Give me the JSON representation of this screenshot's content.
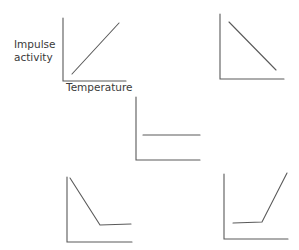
{
  "figure": {
    "ylabel": "Impulse activity",
    "ylabel_lines": [
      "Impulse",
      "activity"
    ],
    "xlabel": "Temperature",
    "line_color": "#5a5a5a",
    "text_color": "#3a3a3a"
  },
  "graphs": [
    {
      "id": "top-left",
      "shape": "linear increasing",
      "axes": {
        "x0": 63,
        "y_top": 18,
        "y_base": 81,
        "x_end": 126
      },
      "points": [
        [
          72,
          74
        ],
        [
          119,
          23
        ]
      ]
    },
    {
      "id": "top-right",
      "shape": "linear decreasing",
      "axes": {
        "x0": 220,
        "y_top": 14,
        "y_base": 79,
        "x_end": 284
      },
      "points": [
        [
          229,
          22
        ],
        [
          276,
          70
        ]
      ]
    },
    {
      "id": "middle",
      "shape": "constant",
      "axes": {
        "x0": 136,
        "y_top": 97,
        "y_base": 160,
        "x_end": 200
      },
      "points": [
        [
          143,
          135
        ],
        [
          200,
          135
        ]
      ]
    },
    {
      "id": "bottom-left",
      "shape": "decreasing then plateau",
      "axes": {
        "x0": 67,
        "y_top": 177,
        "y_base": 242,
        "x_end": 132
      },
      "points": [
        [
          70,
          178
        ],
        [
          100,
          225
        ],
        [
          131,
          224
        ]
      ]
    },
    {
      "id": "bottom-right",
      "shape": "plateau then increasing",
      "axes": {
        "x0": 224,
        "y_top": 174,
        "y_base": 239,
        "x_end": 288
      },
      "points": [
        [
          233,
          223
        ],
        [
          262,
          222
        ],
        [
          287,
          173
        ]
      ]
    }
  ]
}
